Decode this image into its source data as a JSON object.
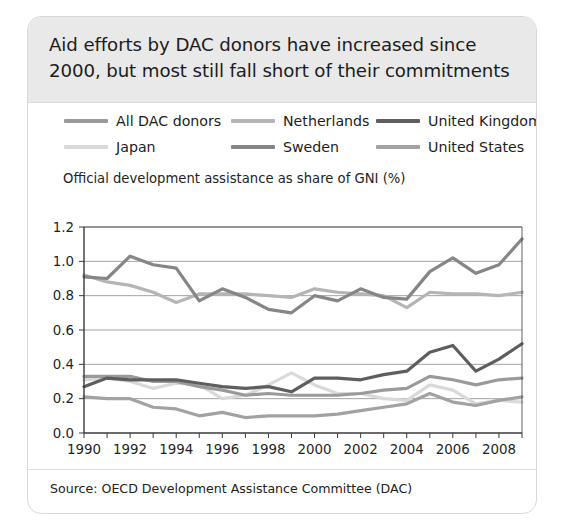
{
  "card": {
    "title": "Aid efforts by DAC donors have increased since 2000, but most still fall short of their commitments",
    "source": "Source: OECD Development Assistance Committee (DAC)",
    "axis_title": "Official development assistance as share of GNI (%)",
    "colors": {
      "band_background": "#e9e9e9",
      "card_background": "#ffffff",
      "border": "#d8d8d8",
      "gridline": "#8c8c8c",
      "axis": "#3a3a3a",
      "text": "#1c1c1c"
    }
  },
  "chart_data": {
    "type": "line",
    "title": "Aid efforts by DAC donors have increased since 2000, but most still fall short of their commitments",
    "subtitle": "Official development assistance as share of GNI (%)",
    "xlabel": "",
    "ylabel": "Official development assistance as share of GNI (%)",
    "xlim": [
      1990,
      2009
    ],
    "ylim": [
      0.0,
      1.2
    ],
    "yticks": [
      "0.0",
      "0.2",
      "0.4",
      "0.6",
      "0.8",
      "1.0",
      "1.2"
    ],
    "ytick_values": [
      0.0,
      0.2,
      0.4,
      0.6,
      0.8,
      1.0,
      1.2
    ],
    "xticks": [
      "1990",
      "1992",
      "1994",
      "1996",
      "1998",
      "2000",
      "2002",
      "2004",
      "2006",
      "2008"
    ],
    "xtick_values": [
      1990,
      1992,
      1994,
      1996,
      1998,
      2000,
      2002,
      2004,
      2006,
      2008
    ],
    "x": [
      1990,
      1991,
      1992,
      1993,
      1994,
      1995,
      1996,
      1997,
      1998,
      1999,
      2000,
      2001,
      2002,
      2003,
      2004,
      2005,
      2006,
      2007,
      2008,
      2009
    ],
    "grid": true,
    "grid_axis": "y",
    "legend_position": "top",
    "series": [
      {
        "name": "All DAC donors",
        "color": "#9a9a9a",
        "values": [
          0.33,
          0.33,
          0.33,
          0.3,
          0.3,
          0.27,
          0.25,
          0.22,
          0.23,
          0.22,
          0.22,
          0.22,
          0.23,
          0.25,
          0.26,
          0.33,
          0.31,
          0.28,
          0.31,
          0.32
        ]
      },
      {
        "name": "Japan",
        "color": "#d9d9d9",
        "values": [
          0.31,
          0.32,
          0.3,
          0.26,
          0.29,
          0.28,
          0.2,
          0.22,
          0.28,
          0.35,
          0.28,
          0.23,
          0.23,
          0.2,
          0.19,
          0.28,
          0.25,
          0.17,
          0.19,
          0.18
        ]
      },
      {
        "name": "Netherlands",
        "color": "#b5b5b5",
        "values": [
          0.92,
          0.88,
          0.86,
          0.82,
          0.76,
          0.81,
          0.81,
          0.81,
          0.8,
          0.79,
          0.84,
          0.82,
          0.81,
          0.8,
          0.73,
          0.82,
          0.81,
          0.81,
          0.8,
          0.82
        ]
      },
      {
        "name": "Sweden",
        "color": "#868686",
        "values": [
          0.91,
          0.9,
          1.03,
          0.98,
          0.96,
          0.77,
          0.84,
          0.79,
          0.72,
          0.7,
          0.8,
          0.77,
          0.84,
          0.79,
          0.78,
          0.94,
          1.02,
          0.93,
          0.98,
          1.13
        ]
      },
      {
        "name": "United Kingdom",
        "color": "#5e5e5e",
        "values": [
          0.27,
          0.32,
          0.31,
          0.31,
          0.31,
          0.29,
          0.27,
          0.26,
          0.27,
          0.24,
          0.32,
          0.32,
          0.31,
          0.34,
          0.36,
          0.47,
          0.51,
          0.36,
          0.43,
          0.52
        ]
      },
      {
        "name": "United States",
        "color": "#a2a2a2",
        "values": [
          0.21,
          0.2,
          0.2,
          0.15,
          0.14,
          0.1,
          0.12,
          0.09,
          0.1,
          0.1,
          0.1,
          0.11,
          0.13,
          0.15,
          0.17,
          0.23,
          0.18,
          0.16,
          0.19,
          0.21
        ]
      }
    ]
  }
}
